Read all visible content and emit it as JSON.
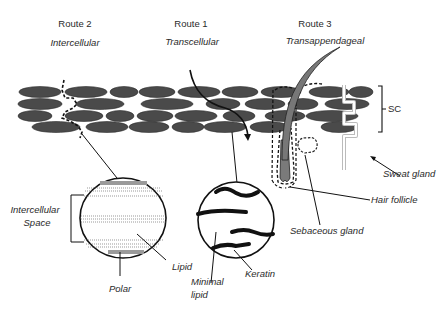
{
  "routes": [
    {
      "name": "Route 2",
      "type": "Intercellular"
    },
    {
      "name": "Route 1",
      "type": "Transcellular"
    },
    {
      "name": "Route 3",
      "type": "Transappendageal"
    }
  ],
  "labels": {
    "sc": "SC",
    "sweat_gland": "Sweat gland",
    "hair_follicle": "Hair follicle",
    "sebaceous_gland": "Sebaceous gland",
    "intercellular_space_line1": "Intercellular",
    "intercellular_space_line2": "Space",
    "lipid": "Lipid",
    "polar": "Polar",
    "minimal_lipid_line1": "Minimal",
    "minimal_lipid_line2": "lipid",
    "keratin": "Keratin"
  },
  "colors": {
    "cell": "#4a4a4a",
    "line": "#1a1a1a",
    "polar_band": "#9a9a9a",
    "follicle": "#7a7a7a",
    "sweat_gland": "#c8c8c8"
  }
}
